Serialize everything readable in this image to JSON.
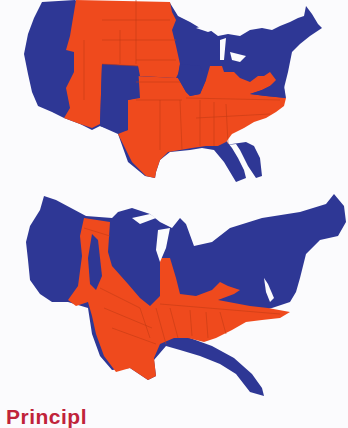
{
  "figure": {
    "maps": [
      {
        "name": "geographic-map",
        "description": "US states map colored by party",
        "colors": {
          "blue": "#2e3795",
          "red": "#ef4a1d",
          "borders": "#c43a14"
        }
      },
      {
        "name": "population-cartogram",
        "description": "US cartogram distorted by population, colored by party",
        "colors": {
          "blue": "#2e3795",
          "red": "#ef4a1d",
          "borders": "#c43a14"
        }
      }
    ]
  },
  "heading": {
    "text": "Principl",
    "color": "#c0233a"
  }
}
